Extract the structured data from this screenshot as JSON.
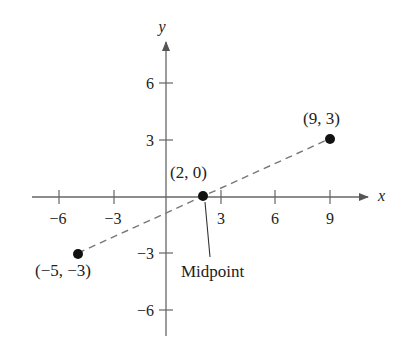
{
  "chart_data": {
    "type": "scatter",
    "title": "",
    "xlabel": "x",
    "ylabel": "y",
    "xlim": [
      -7,
      11
    ],
    "ylim": [
      -7.5,
      8
    ],
    "grid": false,
    "x_ticks": [
      -6,
      -3,
      3,
      6,
      9
    ],
    "x_tick_labels": [
      "−6",
      "−3",
      "3",
      "6",
      "9"
    ],
    "y_ticks": [
      -6,
      -3,
      3,
      6
    ],
    "y_tick_labels": [
      "−6",
      "−3",
      "3",
      "6"
    ],
    "series": [
      {
        "name": "points",
        "points": [
          {
            "x": -5,
            "y": -3,
            "label": "(−5, −3)"
          },
          {
            "x": 2,
            "y": 0,
            "label": "(2, 0)"
          },
          {
            "x": 9,
            "y": 3,
            "label": "(9, 3)"
          }
        ]
      }
    ],
    "segments": [
      {
        "from": [
          -5,
          -3
        ],
        "to": [
          9,
          3
        ],
        "style": "dashed"
      }
    ],
    "annotations": [
      {
        "text": "Midpoint",
        "points_to": [
          2,
          0
        ]
      }
    ]
  },
  "labels": {
    "x_axis": "x",
    "y_axis": "y",
    "p1": "(−5, −3)",
    "p2": "(2, 0)",
    "p3": "(9, 3)",
    "midpoint": "Midpoint",
    "xt_m6": "−6",
    "xt_m3": "−3",
    "xt_3": "3",
    "xt_6": "6",
    "xt_9": "9",
    "yt_6": "6",
    "yt_3": "3",
    "yt_m3": "−3",
    "yt_m6": "−6"
  }
}
